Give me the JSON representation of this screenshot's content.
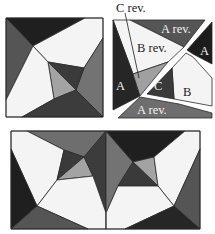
{
  "colors": {
    "white": "#f4f4f4",
    "light_grey": "#a3a3a3",
    "mid_grey": "#6e6e6e",
    "dark_grey": "#4a4a4a",
    "black": "#1f1f1f",
    "outline": "#2a2a2a"
  },
  "block_assembled": {
    "name": "assembled block"
  },
  "block_exploded": {
    "name": "exploded block with piece labels",
    "labels": {
      "c_rev_callout": "C rev.",
      "a_rev_top": "A rev.",
      "b_rev": "B rev.",
      "a_right": "A",
      "a_left": "A",
      "c": "C",
      "b": "B",
      "a_rev_bottom": "A rev."
    }
  },
  "block_pair": {
    "name": "two blocks joined mirrored"
  }
}
